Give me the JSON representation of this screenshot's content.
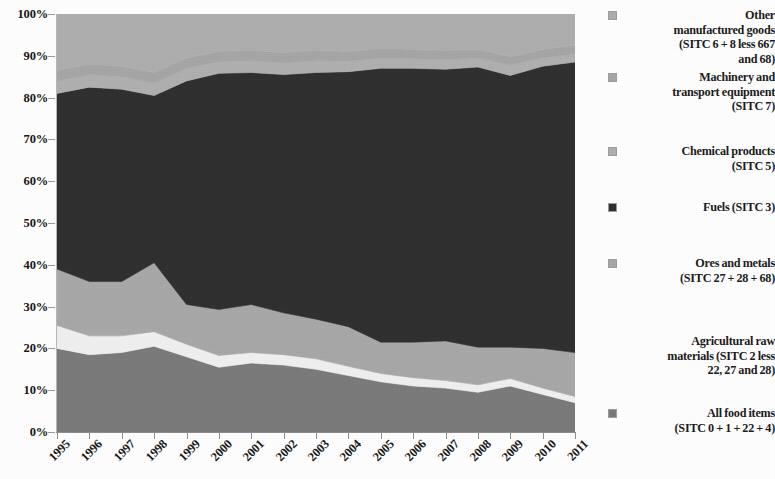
{
  "chart_data": {
    "type": "area",
    "title": "",
    "xlabel": "",
    "ylabel": "",
    "ylim": [
      0,
      100
    ],
    "grid": false,
    "legend_position": "right",
    "stacked": true,
    "categories": [
      "1995",
      "1996",
      "1997",
      "1998",
      "1999",
      "2000",
      "2001",
      "2002",
      "2003",
      "2004",
      "2005",
      "2006",
      "2007",
      "2008",
      "2009",
      "2010",
      "2011"
    ],
    "ytick_labels": [
      "0%",
      "10%",
      "20%",
      "30%",
      "40%",
      "50%",
      "60%",
      "70%",
      "80%",
      "90%",
      "100%"
    ],
    "ytick_values": [
      0,
      10,
      20,
      30,
      40,
      50,
      60,
      70,
      80,
      90,
      100
    ],
    "series": [
      {
        "name": "All food items (SITC 0 + 1 + 22 + 4)",
        "color": "#7a7a7a",
        "values": [
          20.0,
          18.5,
          19.0,
          20.5,
          18.0,
          15.5,
          16.5,
          16.0,
          15.0,
          13.5,
          12.0,
          11.0,
          10.5,
          9.5,
          11.0,
          9.0,
          7.0
        ]
      },
      {
        "name": "Agricultural raw materials (SITC 2 less 22, 27 and 28)",
        "color": "#f0f0f0",
        "values": [
          5.5,
          4.5,
          4.0,
          3.5,
          3.0,
          2.8,
          2.5,
          2.5,
          2.5,
          2.2,
          2.0,
          2.0,
          1.8,
          1.8,
          1.8,
          1.5,
          1.5
        ]
      },
      {
        "name": "Ores and metals (SITC 27 + 28 + 68)",
        "color": "#a8a8a8",
        "values": [
          13.5,
          13.0,
          13.0,
          16.5,
          9.5,
          11.0,
          11.5,
          10.0,
          9.5,
          9.5,
          7.5,
          8.5,
          9.5,
          9.0,
          7.5,
          9.5,
          10.5
        ]
      },
      {
        "name": "Fuels (SITC 3)",
        "color": "#2e2e2e",
        "values": [
          42.0,
          46.5,
          46.0,
          40.0,
          53.5,
          56.5,
          55.5,
          57.0,
          59.0,
          61.0,
          65.5,
          65.5,
          65.0,
          67.0,
          65.0,
          67.5,
          69.5
        ]
      },
      {
        "name": "Chemical products (SITC 5)",
        "color": "#b0b0b0",
        "values": [
          3.0,
          3.0,
          3.0,
          3.0,
          3.0,
          2.8,
          2.8,
          2.8,
          2.8,
          2.5,
          2.5,
          2.3,
          2.3,
          2.2,
          2.5,
          2.0,
          2.0
        ]
      },
      {
        "name": "Machinery and transport equipment (SITC 7)",
        "color": "#a6a6a6",
        "values": [
          2.5,
          2.5,
          2.5,
          2.5,
          2.5,
          2.5,
          2.5,
          2.5,
          2.5,
          2.3,
          2.3,
          2.2,
          2.2,
          2.0,
          2.0,
          2.0,
          2.0
        ]
      },
      {
        "name": "Other manufactured goods (SITC 6 + 8 less 667 and 68)",
        "color": "#aeaeae",
        "values": [
          13.5,
          12.0,
          12.5,
          14.0,
          10.5,
          8.9,
          8.7,
          9.2,
          8.7,
          9.0,
          8.2,
          8.5,
          8.7,
          8.5,
          10.2,
          8.5,
          7.5
        ]
      }
    ]
  },
  "legend": {
    "items": [
      {
        "key": "other-manufactured-goods",
        "lines": [
          "Other",
          "manufactured goods",
          "(SITC 6 + 8 less 667",
          "and 68)"
        ],
        "color": "#aeaeae",
        "has_marker": true
      },
      {
        "key": "machinery-transport-equipment",
        "lines": [
          "Machinery and",
          "transport equipment",
          "(SITC 7)"
        ],
        "color": "#a6a6a6",
        "has_marker": true
      },
      {
        "key": "chemical-products",
        "lines": [
          "Chemical products",
          "(SITC 5)"
        ],
        "color": "#b0b0b0",
        "has_marker": true
      },
      {
        "key": "fuels",
        "lines": [
          "Fuels (SITC 3)"
        ],
        "color": "#2e2e2e",
        "has_marker": true
      },
      {
        "key": "ores-and-metals",
        "lines": [
          "Ores and metals",
          "(SITC 27 + 28 + 68)"
        ],
        "color": "#a8a8a8",
        "has_marker": true
      },
      {
        "key": "agricultural-raw-materials",
        "lines": [
          "Agricultural raw",
          "materials (SITC 2 less",
          "22, 27 and 28)"
        ],
        "color": "#f0f0f0",
        "has_marker": false
      },
      {
        "key": "all-food-items",
        "lines": [
          "All food items",
          "(SITC 0 + 1 + 22 + 4)"
        ],
        "color": "#7a7a7a",
        "has_marker": true
      }
    ]
  }
}
